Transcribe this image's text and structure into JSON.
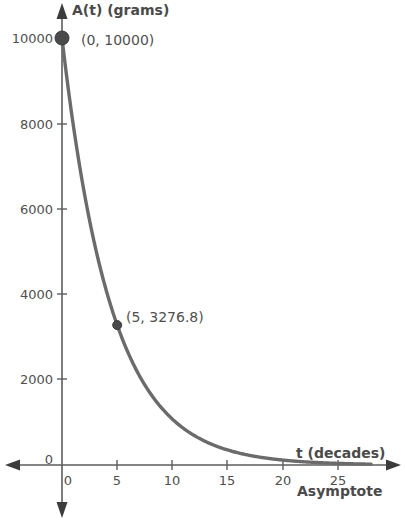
{
  "chart_data": {
    "type": "line",
    "title": "",
    "xlabel": "t (decades)",
    "ylabel": "A(t) (grams)",
    "xlim": [
      0,
      28
    ],
    "ylim": [
      0,
      10500
    ],
    "grid": false,
    "legend": null,
    "function": "A(t) = 10000 * (0.8)^t",
    "decay_base": 0.8,
    "initial_amount": 10000,
    "xticks": [
      0,
      5,
      10,
      15,
      20,
      25
    ],
    "xtick_labels": [
      "0",
      "5",
      "10",
      "15",
      "20",
      "25"
    ],
    "yticks": [
      0,
      2000,
      4000,
      6000,
      8000,
      10000
    ],
    "ytick_labels": [
      "0",
      "2000",
      "4000",
      "6000",
      "8000",
      "10000"
    ],
    "series": [
      {
        "name": "A(t)",
        "color": "#6b6b6b",
        "x": [
          0,
          1,
          2,
          3,
          4,
          5,
          6,
          7,
          8,
          9,
          10,
          11,
          12,
          13,
          14,
          15,
          16,
          17,
          18,
          19,
          20,
          21,
          22,
          23,
          24,
          25,
          26,
          27,
          28
        ],
        "y": [
          10000,
          8000,
          6400,
          5120,
          4096,
          3276.8,
          2621.4,
          2097.2,
          1677.7,
          1342.2,
          1073.7,
          859.0,
          687.2,
          549.8,
          439.8,
          351.8,
          281.5,
          225.2,
          180.1,
          144.1,
          115.3,
          92.2,
          73.8,
          59.0,
          47.2,
          37.8,
          30.2,
          24.2,
          19.3
        ]
      }
    ],
    "annotations": [
      {
        "name": "initial-point",
        "label": "(0, 10000)",
        "x": 0,
        "y": 10000,
        "marker_radius": 7
      },
      {
        "name": "five-decade-point",
        "label": "(5, 3276.8)",
        "x": 5,
        "y": 3276.8,
        "marker_radius": 4.5
      },
      {
        "name": "asymptote",
        "label": "Asymptote",
        "description": "horizontal asymptote at A = 0"
      }
    ]
  },
  "labels": {
    "y_axis_title": "A(t) (grams)",
    "x_axis_title": "t (decades)",
    "asymptote": "Asymptote",
    "origin_zero": "0",
    "point_initial": "(0, 10000)",
    "point_five": "(5, 3276.8)",
    "ytick_10000": "10000",
    "ytick_8000": "8000",
    "ytick_6000": "6000",
    "ytick_4000": "4000",
    "ytick_2000": "2000",
    "xtick_0": "0",
    "xtick_5": "5",
    "xtick_10": "10",
    "xtick_15": "15",
    "xtick_20": "20",
    "xtick_25": "25"
  },
  "colors": {
    "background": "#ffffff",
    "curve": "#6b6b6b",
    "axis": "#5d5d5d",
    "text": "#4f4f4f",
    "marker": "#4a4a4a"
  }
}
